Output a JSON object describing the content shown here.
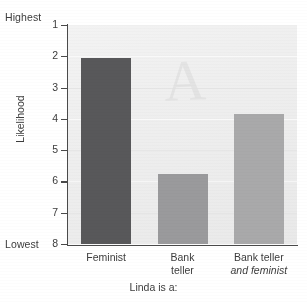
{
  "chart_data": {
    "type": "bar",
    "title": "",
    "subtitle": "",
    "xlabel": "Linda is a:",
    "ylabel": "Likelihood",
    "categories": [
      "Feminist",
      "Bank teller",
      "Bank teller and feminist"
    ],
    "category_lines": [
      [
        "Feminist"
      ],
      [
        "Bank",
        "teller"
      ],
      [
        "Bank teller",
        "and feminist"
      ]
    ],
    "values": [
      2.05,
      5.75,
      3.85
    ],
    "value_labels": [
      "2",
      "6",
      "4"
    ],
    "ylim": [
      1,
      8
    ],
    "y_inverted": true,
    "y_ticks": [
      "1",
      "2",
      "3",
      "4",
      "5",
      "6",
      "7",
      "8"
    ],
    "y_axis_top_caption": "Highest",
    "y_axis_bottom_caption": "Lowest",
    "grid": true,
    "legend": "none",
    "bar_colors": [
      "#58585a",
      "#9a9a9c",
      "#a9a9aa"
    ],
    "plot_background": "#eeeeee",
    "axis_color": "#4a4a4a",
    "watermark_text": "A"
  }
}
